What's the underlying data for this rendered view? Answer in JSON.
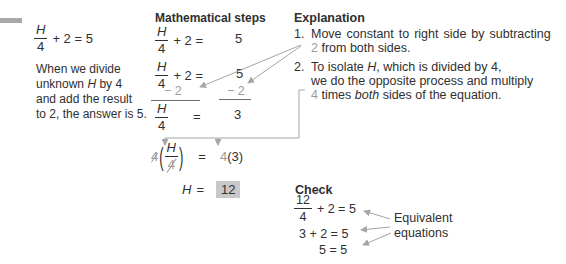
{
  "colors": {
    "text": "#2f2f2f",
    "gray": "#9c9c9c",
    "arrow": "#a5a5a5",
    "highlight": "#c8c8c8",
    "topbar": "#a8a8a8"
  },
  "intro": {
    "equation": {
      "num": "H",
      "den": "4",
      "rest": "+ 2 = 5"
    },
    "caption": {
      "line1": "When we divide",
      "line2_pre": "unknown",
      "line2_var": "H",
      "line2_post": "by 4",
      "line3": "and add the result",
      "line4": "to 2, the answer is 5."
    }
  },
  "steps": {
    "header": "Mathematical steps",
    "eq1": {
      "num": "H",
      "den": "4",
      "rest": "+ 2 =",
      "rhs": "5"
    },
    "eq2": {
      "num": "H",
      "den": "4",
      "rest": "+ 2 =",
      "rhs": "5",
      "minus_left": "− 2",
      "minus_right": "− 2"
    },
    "eq3": {
      "num": "H",
      "den": "4",
      "eq": "=",
      "rhs": "3"
    },
    "eq4": {
      "coeff": "4",
      "open_paren": "(",
      "num": "H",
      "den": "4",
      "close_paren": ")",
      "eq": "=",
      "rhs_coeff": "4",
      "rhs": "(3)"
    },
    "eq5": {
      "var": "H",
      "eq": "=",
      "answer": "12"
    }
  },
  "explanation": {
    "header": "Explanation",
    "item1": {
      "number": "1.",
      "line1": "Move constant to right side by subtracting",
      "line2_gray": "2",
      "line2_rest": "from both sides."
    },
    "item2": {
      "number": "2.",
      "line1_pre": "To isolate",
      "line1_var": "H",
      "line1_post": ", which is divided by 4,",
      "line2": "we do the opposite process and multiply",
      "line3_gray": "4",
      "line3_mid": "times",
      "line3_italic": "both",
      "line3_post": "sides of the equation."
    }
  },
  "check": {
    "header": "Check",
    "eq1": {
      "num": "12",
      "den": "4",
      "rest": "+ 2 = 5"
    },
    "eq2": "3 + 2 = 5",
    "eq3": "5 = 5",
    "label_line1": "Equivalent",
    "label_line2": "equations"
  }
}
